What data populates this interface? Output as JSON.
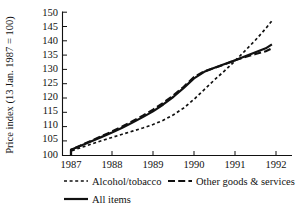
{
  "chart_data": {
    "type": "line",
    "title": "",
    "xlabel": "",
    "ylabel": "Price index (13 Jan. 1987 = 100)",
    "xlim": [
      1987,
      1992
    ],
    "ylim": [
      100,
      150
    ],
    "xticks": [
      "1987",
      "1988",
      "1989",
      "1990",
      "1991",
      "1992"
    ],
    "yticks": [
      "100",
      "105",
      "110",
      "115",
      "120",
      "125",
      "130",
      "135",
      "140",
      "145",
      "150"
    ],
    "grid": false,
    "legend_position": "below",
    "x": [
      1987,
      1987.25,
      1987.5,
      1987.75,
      1988,
      1988.25,
      1988.5,
      1988.75,
      1989,
      1989.25,
      1989.5,
      1989.75,
      1990,
      1990.25,
      1990.5,
      1990.75,
      1991,
      1991.25,
      1991.5,
      1991.75,
      1991.9
    ],
    "series": [
      {
        "name": "Alcohol/tobacco",
        "style": "dotted",
        "values": [
          101.6,
          102.8,
          104.0,
          105.2,
          106.3,
          107.4,
          108.5,
          109.6,
          110.8,
          112.3,
          114.2,
          116.6,
          119.6,
          123.0,
          126.4,
          129.6,
          133.0,
          136.6,
          140.3,
          144.3,
          147.0
        ]
      },
      {
        "name": "Other goods & services",
        "style": "dashed",
        "values": [
          102.0,
          103.6,
          105.2,
          106.8,
          108.4,
          110.1,
          112.0,
          113.9,
          116.0,
          118.4,
          121.0,
          124.0,
          127.4,
          129.4,
          130.6,
          131.8,
          133.2,
          134.4,
          135.4,
          136.4,
          137.4
        ]
      },
      {
        "name": "All items",
        "style": "solid",
        "values": [
          102.0,
          103.5,
          105.0,
          106.5,
          108.0,
          109.7,
          111.5,
          113.4,
          115.4,
          117.8,
          120.5,
          123.6,
          126.9,
          129.2,
          130.6,
          131.9,
          133.2,
          134.6,
          136.0,
          137.4,
          138.8
        ]
      }
    ]
  },
  "legend": {
    "items": [
      {
        "label": "Alcohol/tobacco",
        "style": "dotted"
      },
      {
        "label": "Other goods & services",
        "style": "dashed"
      },
      {
        "label": "All items",
        "style": "solid"
      }
    ]
  }
}
